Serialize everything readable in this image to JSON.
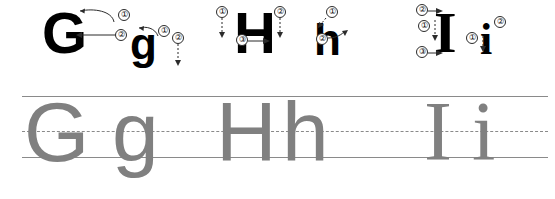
{
  "worksheet": {
    "title": "Handwriting practice worksheet - letters G g H h I i",
    "background_color": "#ffffff",
    "model_ink_color": "#000000",
    "trace_ink_color": "#808080",
    "rule_color": "#8a8a8a"
  },
  "rules": {
    "top_line_label": "top line",
    "mid_line_label": "dashed midline",
    "base_line_label": "baseline"
  },
  "groups": [
    {
      "key": "g",
      "upper": "G",
      "lower": "g",
      "markers_upper": [
        "①",
        "②"
      ],
      "markers_lower": [
        "①",
        "②"
      ],
      "ghost_upper": "G",
      "ghost_lower": "g"
    },
    {
      "key": "h",
      "upper": "H",
      "lower": "h",
      "markers_upper": [
        "①",
        "②",
        "③"
      ],
      "markers_lower": [
        "①",
        "②"
      ],
      "ghost_upper": "H",
      "ghost_lower": "h"
    },
    {
      "key": "i",
      "upper": "I",
      "lower": "i",
      "markers_upper": [
        "①",
        "②",
        "③"
      ],
      "markers_lower": [
        "①",
        "②"
      ],
      "ghost_upper": "I",
      "ghost_lower": "i"
    }
  ]
}
